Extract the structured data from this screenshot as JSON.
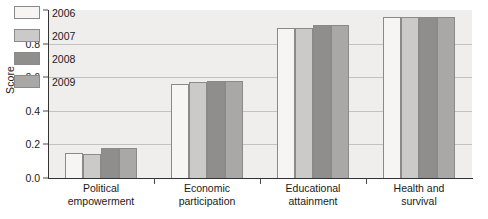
{
  "chart_data": {
    "type": "bar",
    "title": "",
    "xlabel": "",
    "ylabel": "Score",
    "ylim": [
      0.0,
      1.0
    ],
    "ytick_labels": [
      "0.0",
      "0.2",
      "0.4",
      "0.6",
      "0.8",
      "1.0"
    ],
    "ytick_values": [
      0.0,
      0.2,
      0.4,
      0.6,
      0.8,
      1.0
    ],
    "grid": true,
    "legend_position": "top-left-inside",
    "categories": [
      "Political empowerment",
      "Economic participation",
      "Educational attainment",
      "Health and survival"
    ],
    "category_lines": [
      [
        "Political",
        "empowerment"
      ],
      [
        "Economic",
        "participation"
      ],
      [
        "Educational",
        "attainment"
      ],
      [
        "Health and",
        "survival"
      ]
    ],
    "series": [
      {
        "name": "2006",
        "color": "#f6f5f3",
        "values": [
          0.15,
          0.56,
          0.89,
          0.96
        ]
      },
      {
        "name": "2007",
        "color": "#cbcac8",
        "values": [
          0.14,
          0.57,
          0.89,
          0.96
        ]
      },
      {
        "name": "2008",
        "color": "#8f8e8c",
        "values": [
          0.18,
          0.58,
          0.91,
          0.96
        ]
      },
      {
        "name": "2009",
        "color": "#a9a8a6",
        "values": [
          0.18,
          0.58,
          0.91,
          0.96
        ]
      }
    ],
    "plot_background": "#efeeec",
    "gridline_color": "#c2c2c0",
    "axis_color": "#333333",
    "bar_border_color": "#8a8a8a"
  }
}
